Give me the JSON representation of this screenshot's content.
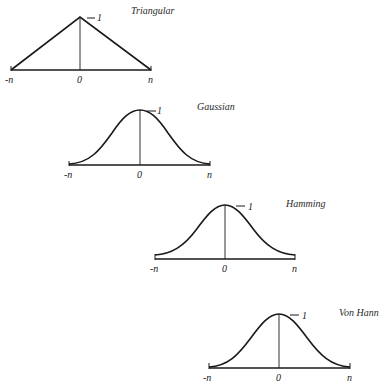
{
  "figure": {
    "panels": [
      {
        "title": "Triangular",
        "peak_label": "1",
        "left_label": "-n",
        "center_label": "0",
        "right_label": "n"
      },
      {
        "title": "Gaussian",
        "peak_label": "1",
        "left_label": "-n",
        "center_label": "0",
        "right_label": "n"
      },
      {
        "title": "Hamming",
        "peak_label": "1",
        "left_label": "-n",
        "center_label": "0",
        "right_label": "n"
      },
      {
        "title": "Von Hann",
        "peak_label": "1",
        "left_label": "-n",
        "center_label": "0",
        "right_label": "n"
      }
    ]
  }
}
